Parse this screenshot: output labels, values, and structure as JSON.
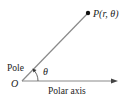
{
  "diagram": {
    "point_label": "P(r, θ)",
    "pole_label": "Pole",
    "origin_label": "O",
    "angle_label": "θ",
    "axis_label": "Polar axis",
    "colors": {
      "line": "#8a8a8a",
      "text": "#222222",
      "point": "#111111"
    }
  }
}
